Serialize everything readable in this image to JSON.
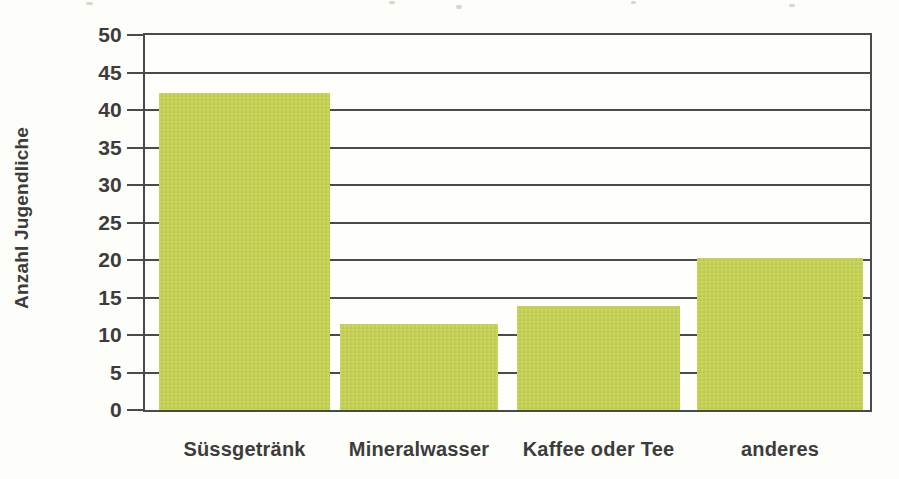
{
  "chart_data": {
    "type": "bar",
    "title": "",
    "categories": [
      "Süssgetränk",
      "Mineralwasser",
      "Kaffee oder Tee",
      "anderes"
    ],
    "values": [
      42.3,
      11.4,
      13.8,
      20.2
    ],
    "xlabel": "",
    "ylabel": "Anzahl Jugendliche",
    "ylim": [
      0,
      50
    ],
    "yticks": [
      0,
      5,
      10,
      15,
      20,
      25,
      30,
      35,
      40,
      45,
      50
    ],
    "grid": "horizontal",
    "legend": "none",
    "bar_color": "#c5d14f",
    "axis_color": "#4a4a4a",
    "text_color": "#3c3c3c",
    "background_color": "#fdfdfa"
  }
}
